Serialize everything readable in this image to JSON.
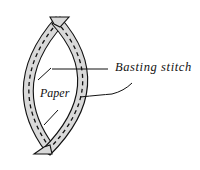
{
  "diagram": {
    "type": "english-paper-piecing-illustration",
    "labels": {
      "basting_stitch": "Basting stitch",
      "paper": "Paper"
    },
    "colors": {
      "fabric_fill": "#d9d9d9",
      "outline": "#111111",
      "background": "#ffffff"
    },
    "components": [
      {
        "name": "left-fabric-strip",
        "description": "curved fabric strip folded around left edge of paper"
      },
      {
        "name": "right-fabric-strip",
        "description": "curved fabric strip folded around right edge of paper"
      },
      {
        "name": "paper-template",
        "description": "lens-shaped paper template in center"
      },
      {
        "name": "basting-stitches",
        "description": "dashed running stitches along each strip"
      }
    ]
  }
}
